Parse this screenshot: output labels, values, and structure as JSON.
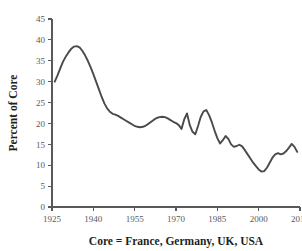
{
  "chart_data": {
    "type": "line",
    "title": "",
    "subtitle": "",
    "xlabel": "Core = France, Germany, UK, USA",
    "ylabel": "Percent of Core",
    "xlim": [
      1925,
      2015
    ],
    "ylim": [
      0,
      45
    ],
    "grid": false,
    "legend_position": "none",
    "x_ticks": [
      1925,
      1940,
      1955,
      1970,
      1985,
      2000,
      2015
    ],
    "x_tick_labels": [
      "1925",
      "1940",
      "1955",
      "1970",
      "1985",
      "2000",
      "2015"
    ],
    "y_ticks": [
      0,
      5,
      10,
      15,
      20,
      25,
      30,
      35,
      40,
      45
    ],
    "y_tick_labels": [
      "0",
      "5",
      "10",
      "15",
      "20",
      "25",
      "30",
      "35",
      "40",
      "45"
    ],
    "line_color": "#4a4a4c",
    "axis_color": "#58595b",
    "background_color": "#ffffff",
    "series": [
      {
        "name": "Percent of Core",
        "x": [
          1926,
          1927,
          1928,
          1929,
          1930,
          1931,
          1932,
          1933,
          1934,
          1935,
          1936,
          1937,
          1938,
          1939,
          1940,
          1941,
          1942,
          1943,
          1944,
          1945,
          1946,
          1947,
          1948,
          1949,
          1950,
          1951,
          1952,
          1953,
          1954,
          1955,
          1956,
          1957,
          1958,
          1959,
          1960,
          1961,
          1962,
          1963,
          1964,
          1965,
          1966,
          1967,
          1968,
          1969,
          1970,
          1971,
          1972,
          1973,
          1974,
          1975,
          1976,
          1977,
          1978,
          1979,
          1980,
          1981,
          1982,
          1983,
          1984,
          1985,
          1986,
          1987,
          1988,
          1989,
          1990,
          1991,
          1992,
          1993,
          1994,
          1995,
          1996,
          1997,
          1998,
          1999,
          2000,
          2001,
          2002,
          2003,
          2004,
          2005,
          2006,
          2007,
          2008,
          2009,
          2010,
          2011,
          2012,
          2013,
          2014
        ],
        "values": [
          30.0,
          31.5,
          33.2,
          34.8,
          36.0,
          37.0,
          37.9,
          38.4,
          38.5,
          38.2,
          37.4,
          36.3,
          35.0,
          33.5,
          31.8,
          30.0,
          28.2,
          26.4,
          24.8,
          23.6,
          22.8,
          22.3,
          22.1,
          21.8,
          21.4,
          21.0,
          20.6,
          20.2,
          19.8,
          19.4,
          19.2,
          19.1,
          19.2,
          19.5,
          19.9,
          20.4,
          20.9,
          21.3,
          21.5,
          21.6,
          21.5,
          21.2,
          20.8,
          20.4,
          20.1,
          19.6,
          18.7,
          21.0,
          22.4,
          19.6,
          18.0,
          17.4,
          19.4,
          21.6,
          22.9,
          23.2,
          22.0,
          20.3,
          18.3,
          16.5,
          15.2,
          16.0,
          17.0,
          16.3,
          15.0,
          14.4,
          14.6,
          14.9,
          14.5,
          13.6,
          12.6,
          11.6,
          10.6,
          9.8,
          9.0,
          8.5,
          8.6,
          9.4,
          10.6,
          11.8,
          12.6,
          12.9,
          12.6,
          12.8,
          13.4,
          14.2,
          15.1,
          14.4,
          13.2
        ]
      }
    ]
  },
  "axis": {
    "y_title": "Percent of Core",
    "x_caption": "Core = France, Germany, UK, USA"
  }
}
